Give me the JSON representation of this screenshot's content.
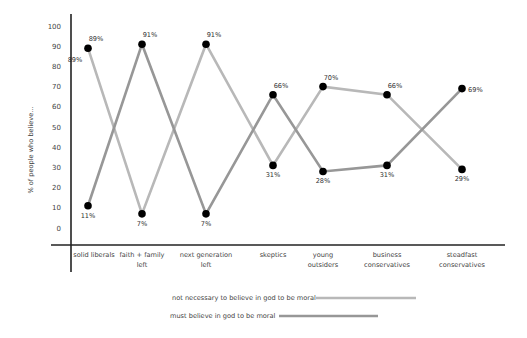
{
  "chart_data": {
    "type": "line",
    "title": "",
    "xlabel": "",
    "ylabel": "% of people who believe...",
    "ylim": [
      0,
      100
    ],
    "yticks": [
      "0",
      "10",
      "20",
      "30",
      "40",
      "50",
      "60",
      "70",
      "80",
      "90",
      "100"
    ],
    "grid": false,
    "legend_position": "bottom",
    "categories": [
      "solid liberals",
      "faith + family left",
      "next generation left",
      "skeptics",
      "young outsiders",
      "business conservatives",
      "steadfast conservatives"
    ],
    "category_lines": [
      [
        "solid liberals"
      ],
      [
        "faith + family",
        "left"
      ],
      [
        "next generation",
        "left"
      ],
      [
        "skeptics"
      ],
      [
        "young",
        "outsiders"
      ],
      [
        "business",
        "conservatives"
      ],
      [
        "steadfast",
        "conservatives"
      ]
    ],
    "series": [
      {
        "name": "not necessary to believe in god to be moral",
        "color": "#b8b8b8",
        "values": [
          89,
          7,
          91,
          31,
          70,
          66,
          29
        ],
        "labels": [
          "89%",
          "7%",
          "91%",
          "31%",
          "70%",
          "66%",
          "29%"
        ]
      },
      {
        "name": "must believe in god to be moral",
        "color": "#979797",
        "values": [
          11,
          91,
          7,
          66,
          28,
          31,
          69
        ],
        "labels": [
          "11%",
          "91%",
          "7%",
          "66%",
          "28%",
          "31%",
          "69%"
        ]
      }
    ],
    "extra_annotations": [
      {
        "text": "89%",
        "near": "solid liberals",
        "series": 0
      }
    ]
  },
  "legend": {
    "items": [
      {
        "label": "not necessary to believe in god to be moral",
        "color": "#b8b8b8"
      },
      {
        "label": "must believe in god to be moral",
        "color": "#979797"
      }
    ]
  }
}
